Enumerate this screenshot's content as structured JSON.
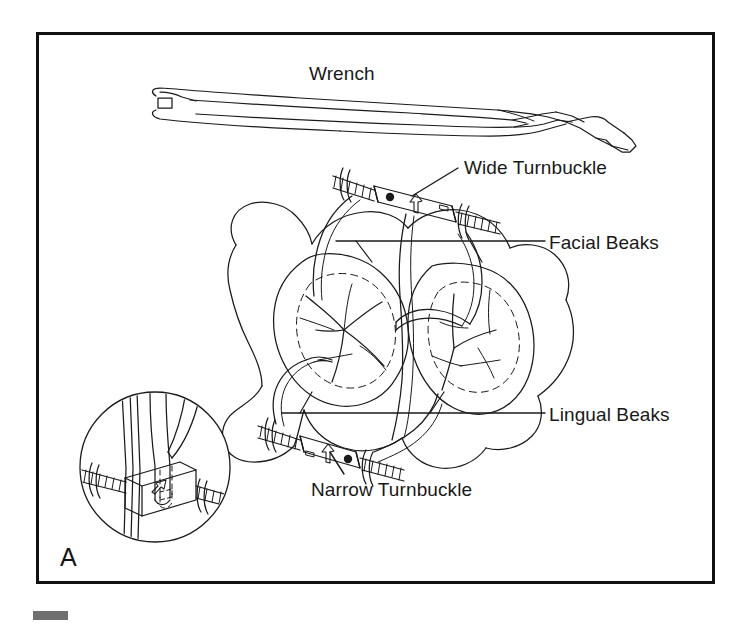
{
  "figure": {
    "panel_letter": "A",
    "caption_labels": {
      "wrench": "Wrench",
      "wide_turnbuckle": "Wide Turnbuckle",
      "facial_beaks": "Facial Beaks",
      "lingual_beaks": "Lingual Beaks",
      "narrow_turnbuckle": "Narrow Turnbuckle"
    },
    "colors": {
      "ink": "#191919",
      "line": "#1a1a1a",
      "frame": "#111111",
      "paper": "#ffffff",
      "scan_mark": "#6f6f6f"
    },
    "frame": {
      "x": 36,
      "y": 32,
      "width": 678,
      "height": 551,
      "stroke_width": 3
    },
    "parts": [
      {
        "name": "wrench",
        "label": "Wrench"
      },
      {
        "name": "wide-turnbuckle",
        "label": "Wide Turnbuckle"
      },
      {
        "name": "facial-beaks",
        "label": "Facial Beaks"
      },
      {
        "name": "lingual-beaks",
        "label": "Lingual Beaks"
      },
      {
        "name": "narrow-turnbuckle",
        "label": "Narrow Turnbuckle"
      }
    ],
    "turnbuckle_markings": {
      "arrow_glyph": "arrow-up-icon",
      "dot_glyph": "dot-marker-icon"
    },
    "inset": {
      "name": "magnified-turnbuckle-detail",
      "shape": "circle",
      "cx": 155,
      "cy": 467,
      "r": 75
    }
  }
}
